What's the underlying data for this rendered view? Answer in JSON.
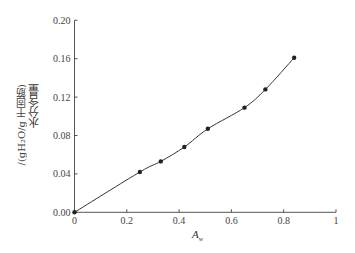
{
  "chart_data": {
    "type": "line",
    "title": "",
    "xlabel": "A_w",
    "xlabel_main": "A",
    "xlabel_sub": "w",
    "ylabel_line1": "水分含量",
    "ylabel_line2": "/(gH₂O/g 干固筋)",
    "xlim": [
      0,
      1
    ],
    "ylim": [
      0,
      0.2
    ],
    "x_ticks": [
      0,
      0.2,
      0.4,
      0.6,
      0.8,
      1
    ],
    "x_tick_labels": [
      "0",
      "0.2",
      "0.4",
      "0.6",
      "0.8",
      "1"
    ],
    "y_ticks": [
      0,
      0.04,
      0.08,
      0.12,
      0.16,
      0.2
    ],
    "y_tick_labels": [
      "0.00",
      "0.04",
      "0.08",
      "0.12",
      "0.16",
      "0.20"
    ],
    "grid": false,
    "legend": null,
    "series": [
      {
        "name": "moisture sorption isotherm",
        "x": [
          0,
          0.25,
          0.33,
          0.42,
          0.51,
          0.65,
          0.73,
          0.84
        ],
        "y": [
          0,
          0.042,
          0.053,
          0.068,
          0.087,
          0.109,
          0.128,
          0.161
        ],
        "marker": "circle",
        "color": "#222222"
      }
    ]
  }
}
